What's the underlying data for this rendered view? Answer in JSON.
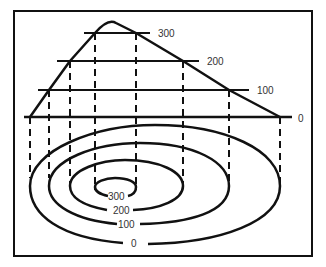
{
  "diagram": {
    "profile_labels": [
      "300",
      "200",
      "100",
      "0"
    ],
    "contour_labels": [
      "300",
      "200",
      "100",
      "0"
    ],
    "colors": {
      "line": "#111111",
      "text": "#333333",
      "background": "#ffffff"
    }
  }
}
